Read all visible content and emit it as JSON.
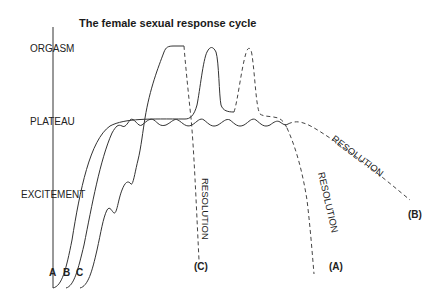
{
  "diagram": {
    "title": "The female sexual response cycle",
    "stages": {
      "orgasm": "ORGASM",
      "plateau": "PLATEAU",
      "excitement": "EXCITEMENT"
    },
    "curves": {
      "a": "A",
      "b": "B",
      "c": "C"
    },
    "resolution_labels": {
      "a": "RESOLUTION",
      "b": "RESOLUTION",
      "c": "RESOLUTION"
    },
    "endpoints": {
      "a": "(A)",
      "b": "(B)",
      "c": "(C)"
    },
    "colors": {
      "line": "#333333",
      "text": "#222222",
      "background": "#ffffff"
    }
  }
}
